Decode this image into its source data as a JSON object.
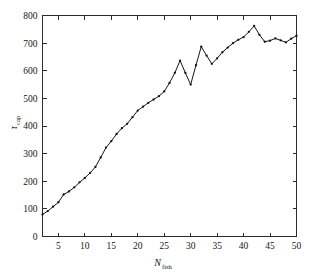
{
  "figure": {
    "background_color": "#ffffff",
    "line_color": "#151515",
    "axis_color": "#2b2b2b",
    "marker_color": "#111111"
  },
  "axes": {
    "x_title_main": "N",
    "x_title_sub": "fish",
    "y_title_main": "τ",
    "y_title_sub": "cap",
    "x_ticks": [
      "5",
      "10",
      "15",
      "20",
      "25",
      "30",
      "35",
      "40",
      "45",
      "50"
    ],
    "y_ticks": [
      "0",
      "100",
      "200",
      "300",
      "400",
      "500",
      "600",
      "700",
      "800"
    ]
  },
  "chart_data": {
    "type": "line",
    "title": "",
    "xlabel": "N_fish",
    "ylabel": "tau_cap",
    "xlim": [
      2,
      50
    ],
    "ylim": [
      0,
      800
    ],
    "xticks": [
      5,
      10,
      15,
      20,
      25,
      30,
      35,
      40,
      45,
      50
    ],
    "yticks": [
      0,
      100,
      200,
      300,
      400,
      500,
      600,
      700,
      800
    ],
    "grid": false,
    "legend": null,
    "marker": "dot",
    "x": [
      2,
      3,
      4,
      5,
      6,
      7,
      8,
      9,
      10,
      11,
      12,
      13,
      14,
      15,
      16,
      17,
      18,
      19,
      20,
      21,
      22,
      23,
      24,
      25,
      26,
      27,
      28,
      29,
      30,
      31,
      32,
      33,
      34,
      35,
      36,
      37,
      38,
      39,
      40,
      41,
      42,
      43,
      44,
      45,
      46,
      47,
      48,
      49,
      50
    ],
    "series": [
      {
        "name": "tau_cap",
        "values": [
          80,
          92,
          108,
          124,
          152,
          163,
          178,
          196,
          212,
          230,
          252,
          286,
          322,
          345,
          371,
          392,
          408,
          432,
          456,
          470,
          484,
          496,
          508,
          525,
          556,
          592,
          637,
          592,
          550,
          620,
          687,
          655,
          625,
          645,
          667,
          684,
          700,
          712,
          722,
          741,
          762,
          730,
          705,
          709,
          717,
          710,
          703,
          716,
          727
        ]
      }
    ]
  }
}
